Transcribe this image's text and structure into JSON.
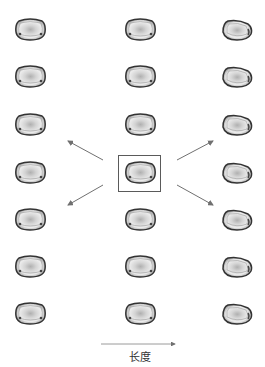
{
  "diagram": {
    "axis_label": "长度",
    "colors": {
      "outline": "#3a3a3a",
      "fill_inner": "#e6e6e6",
      "fill_core": "#b8b8b8",
      "arrow": "#707070",
      "box": "#5a5a5a"
    },
    "columns": [
      {
        "name": "left",
        "shape": "rounded-square",
        "count": 7
      },
      {
        "name": "center",
        "shape": "rounded-square",
        "count": 7,
        "highlighted_row": 4
      },
      {
        "name": "right",
        "shape": "egg-tapered-right",
        "count": 7
      }
    ],
    "arrows": [
      {
        "direction": "up-left"
      },
      {
        "direction": "down-left"
      },
      {
        "direction": "up-right"
      },
      {
        "direction": "down-right"
      },
      {
        "direction": "right",
        "label_ref": "axis_label"
      }
    ]
  }
}
